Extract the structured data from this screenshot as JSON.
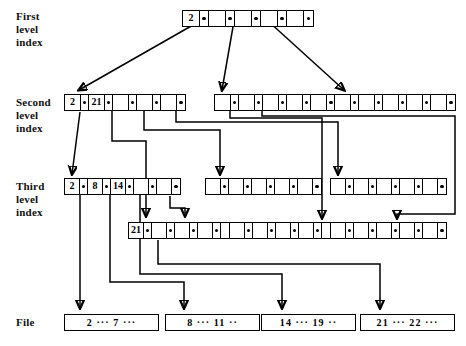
{
  "figure": {
    "kind": "multilevel-index-diagram",
    "labels": [
      {
        "id": "first",
        "text": "First\nlevel\nindex"
      },
      {
        "id": "second",
        "text": "Second\nlevel\nindex"
      },
      {
        "id": "third",
        "text": "Third\nlevel\nindex"
      },
      {
        "id": "file",
        "text": "File"
      }
    ],
    "ellipsis": "···"
  },
  "levels": {
    "first": {
      "label": "First level index",
      "nodes": [
        {
          "id": "l1n1",
          "x": 182,
          "y": 10,
          "cell_width": 17,
          "cells": 9,
          "slots": [
            {
              "type": "key",
              "value": "2"
            },
            {
              "type": "ptr"
            },
            {
              "type": "blank"
            },
            {
              "type": "ptr"
            },
            {
              "type": "blank"
            },
            {
              "type": "ptr"
            },
            {
              "type": "blank"
            },
            {
              "type": "ptr"
            },
            {
              "type": "blank"
            },
            {
              "type": "ptr"
            }
          ]
        }
      ]
    },
    "second": {
      "label": "Second level index",
      "nodes": [
        {
          "id": "l2n1",
          "x": 64,
          "y": 94,
          "cell_width": 16,
          "cells": 9,
          "slots": [
            {
              "type": "key",
              "value": "2"
            },
            {
              "type": "ptr"
            },
            {
              "type": "key",
              "value": "21"
            },
            {
              "type": "ptr"
            },
            {
              "type": "blank"
            },
            {
              "type": "ptr"
            },
            {
              "type": "blank"
            },
            {
              "type": "ptr"
            },
            {
              "type": "blank"
            },
            {
              "type": "ptr"
            }
          ]
        },
        {
          "id": "l2n2",
          "x": 214,
          "y": 94,
          "cell_width": 16,
          "cells": 9,
          "slots": [
            {
              "type": "blank"
            },
            {
              "type": "ptr"
            },
            {
              "type": "blank"
            },
            {
              "type": "ptr"
            },
            {
              "type": "blank"
            },
            {
              "type": "ptr"
            },
            {
              "type": "blank"
            },
            {
              "type": "ptr"
            },
            {
              "type": "blank"
            },
            {
              "type": "ptr"
            }
          ]
        },
        {
          "id": "l2n3",
          "x": 334,
          "y": 94,
          "cell_width": 16,
          "cells": 9,
          "slots": [
            {
              "type": "blank"
            },
            {
              "type": "ptr"
            },
            {
              "type": "blank"
            },
            {
              "type": "ptr"
            },
            {
              "type": "blank"
            },
            {
              "type": "ptr"
            },
            {
              "type": "blank"
            },
            {
              "type": "ptr"
            },
            {
              "type": "blank"
            },
            {
              "type": "ptr"
            }
          ]
        }
      ]
    },
    "third": {
      "label": "Third level index",
      "nodes": [
        {
          "id": "l3n1",
          "x": 64,
          "y": 178,
          "cell_width": 15,
          "cells": 9,
          "slots": [
            {
              "type": "key",
              "value": "2"
            },
            {
              "type": "ptr"
            },
            {
              "type": "key",
              "value": "8"
            },
            {
              "type": "ptr"
            },
            {
              "type": "key",
              "value": "14"
            },
            {
              "type": "ptr"
            },
            {
              "type": "blank"
            },
            {
              "type": "ptr"
            },
            {
              "type": "blank"
            },
            {
              "type": "ptr"
            }
          ]
        },
        {
          "id": "l3n2",
          "x": 205,
          "y": 178,
          "cell_width": 15,
          "cells": 9,
          "slots": [
            {
              "type": "blank"
            },
            {
              "type": "ptr"
            },
            {
              "type": "blank"
            },
            {
              "type": "ptr"
            },
            {
              "type": "blank"
            },
            {
              "type": "ptr"
            },
            {
              "type": "blank"
            },
            {
              "type": "ptr"
            },
            {
              "type": "blank"
            },
            {
              "type": "ptr"
            }
          ]
        },
        {
          "id": "l3n3",
          "x": 330,
          "y": 178,
          "cell_width": 15,
          "cells": 9,
          "slots": [
            {
              "type": "blank"
            },
            {
              "type": "ptr"
            },
            {
              "type": "blank"
            },
            {
              "type": "ptr"
            },
            {
              "type": "blank"
            },
            {
              "type": "ptr"
            },
            {
              "type": "blank"
            },
            {
              "type": "ptr"
            },
            {
              "type": "blank"
            },
            {
              "type": "ptr"
            }
          ]
        },
        {
          "id": "l3n4",
          "x": 128,
          "y": 222,
          "cell_width": 15,
          "cells": 9,
          "slots": [
            {
              "type": "key",
              "value": "21"
            },
            {
              "type": "ptr"
            },
            {
              "type": "blank"
            },
            {
              "type": "ptr"
            },
            {
              "type": "blank"
            },
            {
              "type": "ptr"
            },
            {
              "type": "blank"
            },
            {
              "type": "ptr"
            },
            {
              "type": "blank"
            },
            {
              "type": "ptr"
            }
          ]
        },
        {
          "id": "l3n5",
          "x": 229,
          "y": 222,
          "cell_width": 15,
          "cells": 9,
          "slots": [
            {
              "type": "blank"
            },
            {
              "type": "ptr"
            },
            {
              "type": "blank"
            },
            {
              "type": "ptr"
            },
            {
              "type": "blank"
            },
            {
              "type": "ptr"
            },
            {
              "type": "blank"
            },
            {
              "type": "ptr"
            },
            {
              "type": "blank"
            },
            {
              "type": "ptr"
            }
          ]
        },
        {
          "id": "l3n6",
          "x": 330,
          "y": 222,
          "cell_width": 15,
          "cells": 9,
          "slots": [
            {
              "type": "blank"
            },
            {
              "type": "ptr"
            },
            {
              "type": "blank"
            },
            {
              "type": "ptr"
            },
            {
              "type": "blank"
            },
            {
              "type": "ptr"
            },
            {
              "type": "blank"
            },
            {
              "type": "ptr"
            },
            {
              "type": "blank"
            },
            {
              "type": "ptr"
            }
          ]
        }
      ]
    },
    "file": {
      "label": "File",
      "blocks": [
        {
          "id": "f1",
          "x": 64,
          "y": 314,
          "width": 95,
          "text": "2  ···  7  ···"
        },
        {
          "id": "f2",
          "x": 165,
          "y": 314,
          "width": 95,
          "text": "8  ···  11  ··"
        },
        {
          "id": "f3",
          "x": 261,
          "y": 314,
          "width": 95,
          "text": "14  ···  19  ··"
        },
        {
          "id": "f4",
          "x": 360,
          "y": 314,
          "width": 95,
          "text": "21  ···  22  ···"
        }
      ]
    }
  },
  "connections": [
    {
      "id": "c1",
      "from": "l1n1.ptr1",
      "to": "l2n1",
      "kind": "diagonal-arrow"
    },
    {
      "id": "c2",
      "from": "l1n1.ptr2",
      "to": "l2n2",
      "kind": "diagonal-arrow"
    },
    {
      "id": "c3",
      "from": "l1n1.ptr3",
      "to": "l2n3",
      "kind": "diagonal-arrow"
    },
    {
      "id": "c4",
      "from": "l2n1.ptr1",
      "to": "l3n1",
      "kind": "diagonal-arrow"
    },
    {
      "id": "c5",
      "from": "l2n1.ptr2",
      "to": "l3n4",
      "kind": "orthogonal-arrow"
    },
    {
      "id": "c6",
      "from": "l2n1.ptr3",
      "to": "l3n2",
      "kind": "orthogonal-arrow"
    },
    {
      "id": "c7",
      "from": "l2n1.ptr4",
      "to": "l3n3",
      "kind": "orthogonal-arrow"
    },
    {
      "id": "c8",
      "from": "l2n2.ptr1",
      "to": "l3n5",
      "kind": "orthogonal-arrow"
    },
    {
      "id": "c9",
      "from": "l2n2.ptr2",
      "to": "l3n6",
      "kind": "orthogonal-arrow"
    },
    {
      "id": "c10",
      "from": "l3n1.ptr1",
      "to": "f1",
      "kind": "orthogonal-arrow"
    },
    {
      "id": "c11",
      "from": "l3n1.ptr2",
      "to": "f2",
      "kind": "orthogonal-arrow"
    },
    {
      "id": "c12",
      "from": "l3n1.ptr3",
      "to": "f3",
      "kind": "orthogonal-arrow"
    },
    {
      "id": "c13",
      "from": "l3n4.ptr1",
      "to": "f4",
      "kind": "orthogonal-arrow"
    }
  ]
}
